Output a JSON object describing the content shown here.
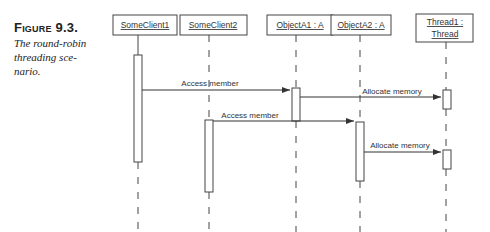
{
  "caption": {
    "figure_label": "Figure 9.3.",
    "description_lines": [
      "The round-robin",
      "threading sce-",
      "nario."
    ]
  },
  "diagram": {
    "type": "uml-sequence",
    "lifelines": [
      {
        "id": "someclient1",
        "label": "SomeClient1"
      },
      {
        "id": "someclient2",
        "label": "SomeClient2"
      },
      {
        "id": "objecta1",
        "label": "ObjectA1 : A"
      },
      {
        "id": "objecta2",
        "label": "ObjectA2 : A"
      },
      {
        "id": "thread1",
        "label_line1": "Thread1 :",
        "label_line2": "Thread"
      }
    ],
    "messages": [
      {
        "from": "someclient1",
        "to": "objecta1",
        "label": "Access member"
      },
      {
        "from": "objecta1",
        "to": "thread1",
        "label": "Allocate memory"
      },
      {
        "from": "someclient2",
        "to": "objecta2",
        "label": "Access member"
      },
      {
        "from": "objecta2",
        "to": "thread1",
        "label": "Allocate memory"
      }
    ]
  }
}
